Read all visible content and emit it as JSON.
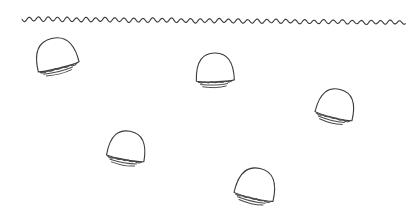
{
  "canvas": {
    "width": 415,
    "height": 217,
    "background": "#ffffff",
    "title": "jellyfish-line-drawing"
  },
  "palette": {
    "ink": "#3a3a3a",
    "ink_light": "#4a4a4a",
    "fill": "#ffffff"
  },
  "water_surface": {
    "label": "water-surface-wave",
    "start_x": 22,
    "end_x": 406,
    "baseline_y": 19,
    "amplitude": 2.2,
    "wavelength": 9.5,
    "tilt": 3.5,
    "stroke": "#3a3a3a",
    "stroke_width": 1.1
  },
  "jellyfish": [
    {
      "label": "jellyfish-1",
      "cx": 56,
      "cy": 56,
      "rx": 21,
      "ry": 18,
      "rotation": -14,
      "tentacle_count": 3
    },
    {
      "label": "jellyfish-2",
      "cx": 215,
      "cy": 70,
      "rx": 19,
      "ry": 17,
      "rotation": -2,
      "tentacle_count": 3
    },
    {
      "label": "jellyfish-3",
      "cx": 336,
      "cy": 106,
      "rx": 19,
      "ry": 17,
      "rotation": 14,
      "tentacle_count": 3
    },
    {
      "label": "jellyfish-4",
      "cx": 127,
      "cy": 148,
      "rx": 19,
      "ry": 17,
      "rotation": 10,
      "tentacle_count": 3
    },
    {
      "label": "jellyfish-5",
      "cx": 256,
      "cy": 186,
      "rx": 20,
      "ry": 18,
      "rotation": 13,
      "tentacle_count": 3
    }
  ]
}
